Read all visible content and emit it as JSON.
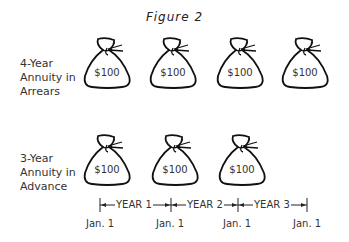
{
  "figure": {
    "title": "Figure 2"
  },
  "rows": [
    {
      "label_lines": [
        "4-Year",
        "Annuity in",
        "Arrears"
      ],
      "bags": [
        "$100",
        "$100",
        "$100",
        "$100"
      ]
    },
    {
      "label_lines": [
        "3-Year",
        "Annuity in",
        "Advance"
      ],
      "bags": [
        "$100",
        "$100",
        "$100"
      ]
    }
  ],
  "timeline": {
    "periods": [
      "YEAR 1",
      "YEAR 2",
      "YEAR 3"
    ],
    "dates": [
      "Jan. 1",
      "Jan. 1",
      "Jan. 1",
      "Jan. 1"
    ]
  }
}
